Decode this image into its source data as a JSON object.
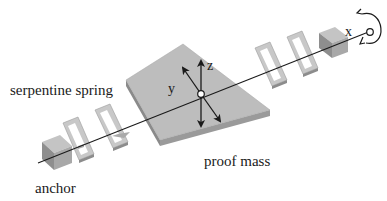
{
  "diagram": {
    "labels": {
      "serpentine_spring": "serpentine spring",
      "proof_mass": "proof mass",
      "anchor": "anchor"
    },
    "axes": {
      "x": "x",
      "y": "y",
      "z": "z"
    },
    "colors": {
      "mass_top": "#bdbdbd",
      "mass_side": "#8a8a8a",
      "mass_front": "#9e9e9e",
      "spring_light": "#c8c8c8",
      "spring_dark": "#8c8c8c",
      "anchor_top": "#c4c4c4",
      "anchor_side": "#8e8e8e",
      "anchor_front": "#a8a8a8",
      "line": "#1a1a1a"
    },
    "icons": {
      "rotation": "rotation-arrow-icon",
      "origin": "origin-circle-icon"
    }
  }
}
